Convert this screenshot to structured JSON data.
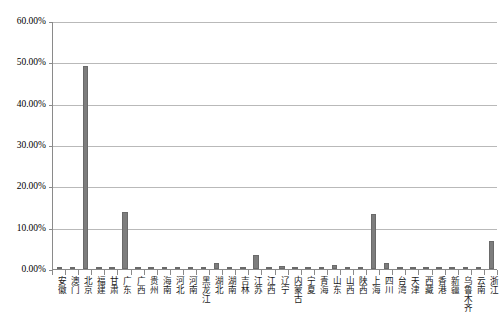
{
  "chart_data": {
    "type": "bar",
    "title": "",
    "xlabel": "",
    "ylabel": "",
    "ylim": [
      0,
      60
    ],
    "ytick_labels": [
      "0.00%",
      "10.00%",
      "20.00%",
      "30.00%",
      "40.00%",
      "50.00%",
      "60.00%"
    ],
    "ytick_values": [
      0,
      10,
      20,
      30,
      40,
      50,
      60
    ],
    "grid": true,
    "legend": "none",
    "bar_color": "#7d7d7d",
    "value_unit": "percent",
    "categories": [
      "安徽",
      "澳门",
      "北京",
      "福建",
      "甘肃",
      "广东",
      "广西",
      "贵州",
      "海南",
      "河北",
      "河南",
      "黑龙江",
      "湖北",
      "湖南",
      "吉林",
      "江苏",
      "江西",
      "辽宁",
      "内蒙古",
      "宁夏",
      "青海",
      "山东",
      "山西",
      "陕西",
      "上海",
      "四川",
      "台湾",
      "天津",
      "西藏",
      "香港",
      "新疆",
      "乌鲁木齐",
      "云南",
      "浙江"
    ],
    "values": [
      0.5,
      0.15,
      49.0,
      0.45,
      0.2,
      13.9,
      0.3,
      0.25,
      0.2,
      0.4,
      0.55,
      0.35,
      1.4,
      0.3,
      0.45,
      3.5,
      0.3,
      0.8,
      0.25,
      0.15,
      0.2,
      1.0,
      0.3,
      0.45,
      13.3,
      1.5,
      0.25,
      0.5,
      0.1,
      0.35,
      0.25,
      0.2,
      0.35,
      6.8
    ]
  }
}
